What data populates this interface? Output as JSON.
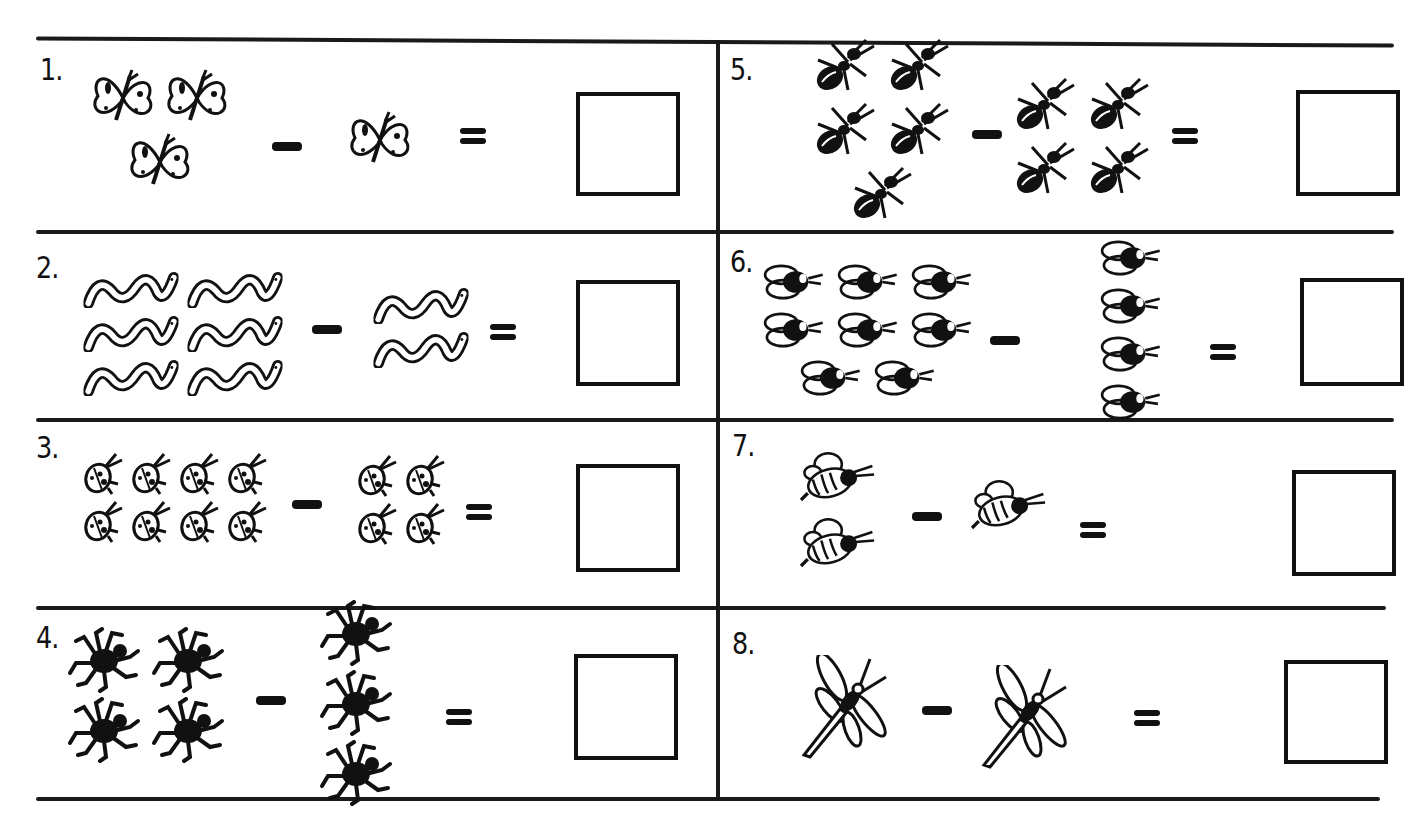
{
  "worksheet": {
    "problems": [
      {
        "number": "1.",
        "insect": "butterfly",
        "left_count": 3,
        "right_count": 1,
        "operator": "-",
        "equals": "=",
        "answer": ""
      },
      {
        "number": "2.",
        "insect": "worm",
        "left_count": 6,
        "right_count": 2,
        "operator": "-",
        "equals": "=",
        "answer": ""
      },
      {
        "number": "3.",
        "insect": "ladybug",
        "left_count": 8,
        "right_count": 4,
        "operator": "-",
        "equals": "=",
        "answer": ""
      },
      {
        "number": "4.",
        "insect": "spider",
        "left_count": 4,
        "right_count": 3,
        "operator": "-",
        "equals": "=",
        "answer": ""
      },
      {
        "number": "5.",
        "insect": "ant",
        "left_count": 5,
        "right_count": 4,
        "operator": "-",
        "equals": "=",
        "answer": ""
      },
      {
        "number": "6.",
        "insect": "fly",
        "left_count": 8,
        "right_count": 4,
        "operator": "-",
        "equals": "=",
        "answer": ""
      },
      {
        "number": "7.",
        "insect": "bee",
        "left_count": 2,
        "right_count": 1,
        "operator": "-",
        "equals": "=",
        "answer": ""
      },
      {
        "number": "8.",
        "insect": "dragonfly",
        "left_count": 1,
        "right_count": 1,
        "operator": "-",
        "equals": "=",
        "answer": ""
      }
    ]
  },
  "colors": {
    "ink": "#111111",
    "paper": "#ffffff"
  }
}
